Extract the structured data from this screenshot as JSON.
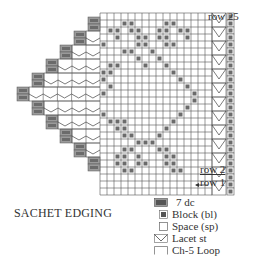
{
  "title": "SACHET EDGING",
  "row_labels": {
    "top": "row 25",
    "row2": "row 2",
    "row1": "row 1"
  },
  "legend": [
    {
      "symbol": "seven-dc",
      "label": "7 dc"
    },
    {
      "symbol": "block",
      "label": "Block (bl)"
    },
    {
      "symbol": "space",
      "label": "Space (sp)"
    },
    {
      "symbol": "lacet",
      "label": "Lacet st"
    },
    {
      "symbol": "ch5-loop",
      "label": "Ch-5 Loop"
    }
  ],
  "colors": {
    "grid_line": "#555555",
    "block_fill": "#6b6b6b",
    "block_border": "#9a9a9a",
    "background": "#ffffff"
  },
  "chart_grid": {
    "rows": 26,
    "main_cols": 16,
    "cell_px": 7,
    "origin_x": 100,
    "origin_y": 13
  }
}
